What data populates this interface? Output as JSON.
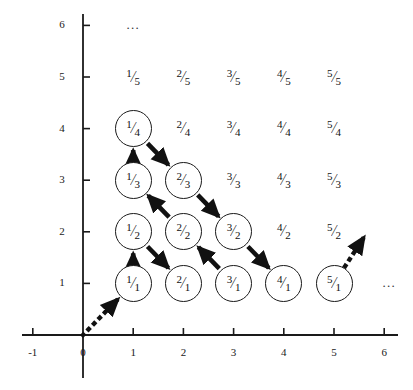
{
  "figure": {
    "type": "diagram-grid",
    "background_color": "#ffffff",
    "ink_color": "#1a1a1a"
  },
  "axes": {
    "x_ticks": [
      "-1",
      "0",
      "1",
      "2",
      "3",
      "4",
      "5",
      "6"
    ],
    "y_ticks": [
      "1",
      "2",
      "3",
      "4",
      "5",
      "6"
    ],
    "x_range": [
      -1,
      6
    ],
    "y_range": [
      0,
      6
    ],
    "origin_label": "0"
  },
  "ellipses": [
    {
      "name": "top-ellipsis",
      "text": "...",
      "x": 1,
      "y": 6
    },
    {
      "name": "right-ellipsis",
      "text": "...",
      "x": 6.1,
      "y": 1
    }
  ],
  "chart_data": {
    "type": "scatter",
    "xlabel": "",
    "ylabel": "",
    "xlim": [
      -1,
      6
    ],
    "ylim": [
      0,
      6
    ],
    "grid": false,
    "legend": "none",
    "cells": [
      {
        "x": 1,
        "y": 1,
        "numerator": "1",
        "denominator": "1",
        "circled": true
      },
      {
        "x": 2,
        "y": 1,
        "numerator": "2",
        "denominator": "1",
        "circled": true
      },
      {
        "x": 3,
        "y": 1,
        "numerator": "3",
        "denominator": "1",
        "circled": true
      },
      {
        "x": 4,
        "y": 1,
        "numerator": "4",
        "denominator": "1",
        "circled": true
      },
      {
        "x": 5,
        "y": 1,
        "numerator": "5",
        "denominator": "1",
        "circled": true
      },
      {
        "x": 1,
        "y": 2,
        "numerator": "1",
        "denominator": "2",
        "circled": true
      },
      {
        "x": 2,
        "y": 2,
        "numerator": "2",
        "denominator": "2",
        "circled": true
      },
      {
        "x": 3,
        "y": 2,
        "numerator": "3",
        "denominator": "2",
        "circled": true
      },
      {
        "x": 4,
        "y": 2,
        "numerator": "4",
        "denominator": "2",
        "circled": false
      },
      {
        "x": 5,
        "y": 2,
        "numerator": "5",
        "denominator": "2",
        "circled": false
      },
      {
        "x": 1,
        "y": 3,
        "numerator": "1",
        "denominator": "3",
        "circled": true
      },
      {
        "x": 2,
        "y": 3,
        "numerator": "2",
        "denominator": "3",
        "circled": true
      },
      {
        "x": 3,
        "y": 3,
        "numerator": "3",
        "denominator": "3",
        "circled": false
      },
      {
        "x": 4,
        "y": 3,
        "numerator": "4",
        "denominator": "3",
        "circled": false
      },
      {
        "x": 5,
        "y": 3,
        "numerator": "5",
        "denominator": "3",
        "circled": false
      },
      {
        "x": 1,
        "y": 4,
        "numerator": "1",
        "denominator": "4",
        "circled": true
      },
      {
        "x": 2,
        "y": 4,
        "numerator": "2",
        "denominator": "4",
        "circled": false
      },
      {
        "x": 3,
        "y": 4,
        "numerator": "3",
        "denominator": "4",
        "circled": false
      },
      {
        "x": 4,
        "y": 4,
        "numerator": "4",
        "denominator": "4",
        "circled": false
      },
      {
        "x": 5,
        "y": 4,
        "numerator": "5",
        "denominator": "4",
        "circled": false
      },
      {
        "x": 1,
        "y": 5,
        "numerator": "1",
        "denominator": "5",
        "circled": false
      },
      {
        "x": 2,
        "y": 5,
        "numerator": "2",
        "denominator": "5",
        "circled": false
      },
      {
        "x": 3,
        "y": 5,
        "numerator": "3",
        "denominator": "5",
        "circled": false
      },
      {
        "x": 4,
        "y": 5,
        "numerator": "4",
        "denominator": "5",
        "circled": false
      },
      {
        "x": 5,
        "y": 5,
        "numerator": "5",
        "denominator": "5",
        "circled": false
      }
    ],
    "path_arrows": [
      {
        "from": [
          1,
          1
        ],
        "to": [
          1,
          2
        ],
        "style": "solid"
      },
      {
        "from": [
          1,
          2
        ],
        "to": [
          2,
          1
        ],
        "style": "solid"
      },
      {
        "from": [
          3,
          1
        ],
        "to": [
          2,
          2
        ],
        "style": "solid"
      },
      {
        "from": [
          2,
          2
        ],
        "to": [
          1,
          3
        ],
        "style": "solid"
      },
      {
        "from": [
          1,
          3
        ],
        "to": [
          1,
          4
        ],
        "style": "solid"
      },
      {
        "from": [
          1,
          4
        ],
        "to": [
          2,
          3
        ],
        "style": "solid"
      },
      {
        "from": [
          2,
          3
        ],
        "to": [
          3,
          2
        ],
        "style": "solid"
      },
      {
        "from": [
          3,
          2
        ],
        "to": [
          4,
          1
        ],
        "style": "solid"
      }
    ],
    "dotted_arrows": [
      {
        "from": [
          0,
          0
        ],
        "to": [
          1,
          1
        ],
        "style": "dotted",
        "name": "entry-arrow"
      },
      {
        "from": [
          5,
          1
        ],
        "to": [
          5.6,
          1.9
        ],
        "style": "dotted",
        "name": "exit-arrow"
      }
    ]
  }
}
